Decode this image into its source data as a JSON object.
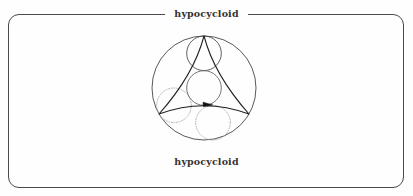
{
  "page": {
    "background_color": "#fefefe",
    "frame": {
      "border_color": "#4a4a4a",
      "corner_radius": "11px",
      "style": "fieldset"
    }
  },
  "legend": {
    "label": "hypocycloid"
  },
  "caption": {
    "label": "hypocycloid"
  },
  "figure": {
    "name": "hypocycloid-deltoid-construction",
    "colors": {
      "fixed_circle": "#3a3a3a",
      "curve": "#1e1e1e",
      "rolling_circle_solid": "#3a3a3a",
      "rolling_circle_dotted": "#a8a49f",
      "generator_circle": "#6f6b67",
      "arrow": "#111111"
    },
    "geometry": {
      "fixed_circle": {
        "cx": 204,
        "cy": 70,
        "r": 52
      },
      "rolling_circle_radius": 17.3,
      "cusp_count": 3,
      "cusps": [
        {
          "x": 204,
          "y": 18,
          "label": "top-cusp"
        },
        {
          "x": 159,
          "y": 96,
          "label": "bottom-left-cusp"
        },
        {
          "x": 249,
          "y": 96,
          "label": "bottom-right-cusp"
        }
      ],
      "rolling_circles": [
        {
          "name": "top-rolling-circle",
          "cx": 204,
          "cy": 35.3,
          "r": 17.3,
          "stroke": "solid"
        },
        {
          "name": "left-rolling-circle",
          "cx": 174,
          "cy": 87.3,
          "r": 17.3,
          "stroke": "dotted"
        },
        {
          "name": "bottom-rolling-circle",
          "cx": 213,
          "cy": 104.7,
          "r": 17.3,
          "stroke": "dotted"
        },
        {
          "name": "generator-circle",
          "cx": 204,
          "cy": 70,
          "r": 17.3,
          "stroke": "solid-gray"
        }
      ],
      "rotation_arrow": {
        "x": 210,
        "y": 86,
        "direction": "clockwise"
      }
    }
  }
}
